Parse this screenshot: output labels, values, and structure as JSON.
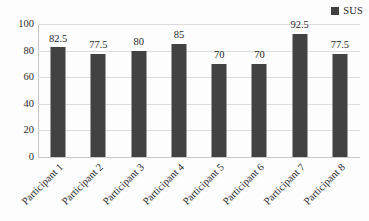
{
  "chart_data": {
    "type": "bar",
    "title": "",
    "xlabel": "",
    "ylabel": "",
    "categories": [
      "Participant 1",
      "Participant 2",
      "Participant 3",
      "Participant 4",
      "Participant 5",
      "Participant 6",
      "Participant 7",
      "Participant 8"
    ],
    "values": [
      82.5,
      77.5,
      80,
      85,
      70,
      70,
      92.5,
      77.5
    ],
    "value_labels": [
      "82.5",
      "77.5",
      "80",
      "85",
      "70",
      "70",
      "92.5",
      "77.5"
    ],
    "series": [
      {
        "name": "SUS",
        "values": [
          82.5,
          77.5,
          80,
          85,
          70,
          70,
          92.5,
          77.5
        ],
        "color": "#424242"
      }
    ],
    "ylim": [
      0,
      100
    ],
    "ytick_values": [
      0,
      20,
      40,
      60,
      80,
      100
    ],
    "ytick_labels": [
      "0",
      "20",
      "40",
      "60",
      "80",
      "100"
    ],
    "grid": true,
    "grid_color": "#dcdcdc",
    "legend_position": "top-right",
    "legend_entries": [
      "SUS"
    ],
    "xtick_rotation": -45,
    "background_color": "#fdfdfd"
  },
  "legend": {
    "label": "SUS",
    "swatch_color": "#424242"
  }
}
